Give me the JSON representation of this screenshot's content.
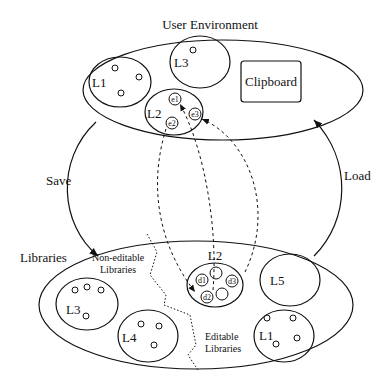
{
  "diagram": {
    "user_env": {
      "title": "User Environment",
      "libraries": [
        {
          "label": "L1"
        },
        {
          "label": "L3"
        },
        {
          "label": "L2",
          "elements": [
            "e1",
            "e2",
            "e3"
          ]
        }
      ],
      "clipboard": "Clipboard"
    },
    "arrows": {
      "save": "Save",
      "load": "Load"
    },
    "libraries_store": {
      "title": "Libraries",
      "non_editable_label_line1": "Non-editable",
      "non_editable_label_line2": "Libraries",
      "editable_label_line1": "Editable",
      "editable_label_line2": "Libraries",
      "non_editable": [
        {
          "label": "L3"
        },
        {
          "label": "L4"
        }
      ],
      "editable": [
        {
          "label": "L2",
          "elements": [
            "d1",
            "d2",
            "d3"
          ]
        },
        {
          "label": "L5"
        },
        {
          "label": "L1"
        }
      ]
    }
  }
}
